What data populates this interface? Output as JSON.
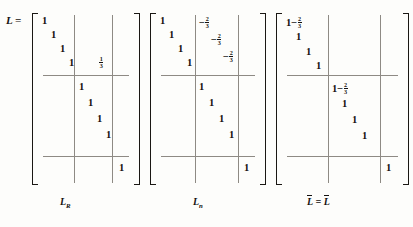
{
  "equation": {
    "lead": "L ="
  },
  "matrices": [
    {
      "name": "L_R",
      "label_base": "L",
      "label_sub": "R",
      "overline": false,
      "label_text": "L",
      "cells": [
        {
          "text": "1",
          "block": "top-left",
          "col": 0,
          "row": 0
        },
        {
          "text": "1",
          "block": "top-left",
          "col": 1,
          "row": 1
        },
        {
          "text": "1",
          "block": "top-left",
          "col": 2,
          "row": 2
        },
        {
          "text": "1",
          "block": "top-left",
          "col": 3,
          "row": 3
        },
        {
          "frac": {
            "num": "1",
            "den": "3"
          },
          "block": "top-right",
          "col": 0,
          "row": 3
        },
        {
          "text": "1",
          "block": "mid-mid",
          "col": 0,
          "row": 0
        },
        {
          "text": "1",
          "block": "mid-mid",
          "col": 1,
          "row": 1
        },
        {
          "text": "1",
          "block": "mid-mid",
          "col": 2,
          "row": 2
        },
        {
          "text": "1",
          "block": "mid-mid",
          "col": 3,
          "row": 3
        },
        {
          "text": "1",
          "block": "bot-right",
          "col": 0,
          "row": 0
        }
      ]
    },
    {
      "name": "L_n",
      "label_base": "L",
      "label_sub": "n",
      "overline": false,
      "label_text": "L",
      "cells": [
        {
          "text": "1",
          "block": "top-left",
          "col": 0,
          "row": 0
        },
        {
          "text": "1",
          "block": "top-left",
          "col": 1,
          "row": 1
        },
        {
          "text": "1",
          "block": "top-left",
          "col": 2,
          "row": 2
        },
        {
          "text": "1",
          "block": "top-left",
          "col": 3,
          "row": 3
        },
        {
          "minusfrac": {
            "num": "2",
            "den": "3"
          },
          "block": "top-right",
          "col": 0,
          "row": 0
        },
        {
          "minusfrac": {
            "num": "2",
            "den": "3"
          },
          "block": "top-right",
          "col": 1,
          "row": 1
        },
        {
          "minusfrac": {
            "num": "2",
            "den": "3"
          },
          "block": "top-right",
          "col": 2,
          "row": 2
        },
        {
          "text": "1",
          "block": "mid-mid",
          "col": 0,
          "row": 0
        },
        {
          "text": "1",
          "block": "mid-mid",
          "col": 1,
          "row": 1
        },
        {
          "text": "1",
          "block": "mid-mid",
          "col": 2,
          "row": 2
        },
        {
          "text": "1",
          "block": "mid-mid",
          "col": 3,
          "row": 3
        },
        {
          "text": "1",
          "block": "bot-right",
          "col": 0,
          "row": 0
        }
      ]
    },
    {
      "name": "Lbar_equals_L",
      "label_base": "L",
      "label_sub": "",
      "overline": true,
      "label_text": "= L",
      "cells": [
        {
          "onemfrac": {
            "num": "2",
            "den": "3"
          },
          "block": "top-left",
          "col": 0,
          "row": 0
        },
        {
          "text": "1",
          "block": "top-left",
          "col": 1,
          "row": 1
        },
        {
          "text": "1",
          "block": "top-left",
          "col": 2,
          "row": 2
        },
        {
          "text": "1",
          "block": "top-left",
          "col": 3,
          "row": 3
        },
        {
          "onemfrac": {
            "num": "2",
            "den": "3"
          },
          "block": "mid-mid",
          "col": 0,
          "row": 0
        },
        {
          "text": "1",
          "block": "mid-mid",
          "col": 1,
          "row": 1
        },
        {
          "text": "1",
          "block": "mid-mid",
          "col": 2,
          "row": 2
        },
        {
          "text": "1",
          "block": "mid-mid",
          "col": 3,
          "row": 3
        },
        {
          "text": "1",
          "block": "bot-right",
          "col": 0,
          "row": 0
        }
      ]
    }
  ],
  "labels": {
    "first": "L",
    "first_sub": "R",
    "second": "L",
    "second_sub": "n",
    "third": "= L"
  },
  "colors": {
    "ink": "#14110f",
    "rule": "#8e8a84",
    "background": "#fdfdfb"
  }
}
